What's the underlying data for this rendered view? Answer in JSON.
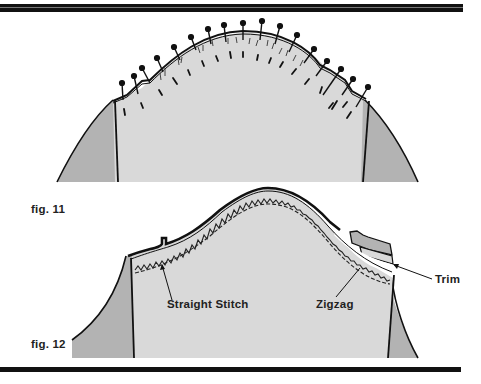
{
  "figures": [
    {
      "id": "fig11",
      "caption": "fig. 11",
      "description": "Sleeve cap pinned into armhole with pins along the seam line"
    },
    {
      "id": "fig12",
      "caption": "fig. 12",
      "description": "Sleeve seam stitched with straight stitch and zigzag, seam allowance trimmed",
      "callouts": {
        "straight_stitch": "Straight Stitch",
        "zigzag": "Zigzag",
        "trim": "Trim"
      }
    }
  ],
  "colors": {
    "sleeve_fill": "#d9d9d9",
    "bodice_fill": "#b3b3b3",
    "line": "#111111",
    "background": "#ffffff"
  }
}
